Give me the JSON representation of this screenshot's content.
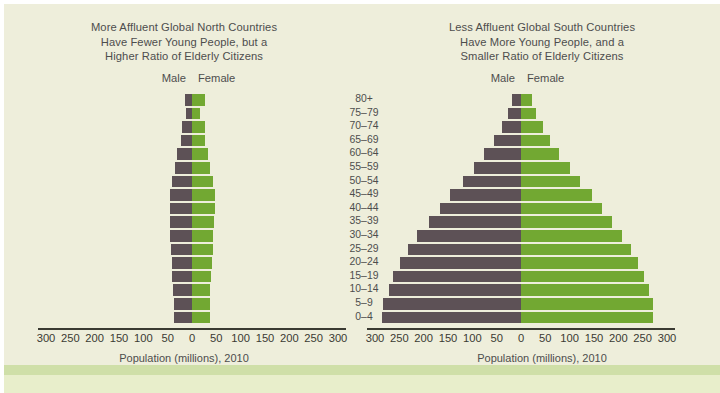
{
  "colors": {
    "background": "#eeeedb",
    "page": "#ffffff",
    "band": "#cfdfa8",
    "band_inner": "#e8eecb",
    "male": "#5d5156",
    "female": "#72a832",
    "axis": "#3a3a32",
    "text": "#4d4d4d"
  },
  "legend": {
    "male_label": "Male",
    "female_label": "Female"
  },
  "axis": {
    "title": "Population (millions), 2010",
    "ticks_left": [
      "300",
      "250",
      "200",
      "150",
      "100",
      "50",
      "0",
      "50",
      "100",
      "150",
      "200",
      "250",
      "300"
    ],
    "max": 300,
    "tick_step": 50
  },
  "age_groups": [
    "80+",
    "75–79",
    "70–74",
    "65–69",
    "60–64",
    "55–59",
    "50–54",
    "45–49",
    "40–44",
    "35–39",
    "30–34",
    "25–29",
    "20–24",
    "15–19",
    "10–14",
    "5–9",
    "0–4"
  ],
  "chart_data": [
    {
      "type": "bar",
      "id": "global-north",
      "orientation": "population-pyramid",
      "title": "More Affluent Global North Countries Have Fewer Young People, but a Higher Ratio of Elderly Citizens",
      "title_lines": [
        "More Affluent Global North Countries",
        "Have Fewer Young People, but a",
        "Higher Ratio of Elderly Citizens"
      ],
      "xlabel": "Population (millions), 2010",
      "ylabel": "",
      "xlim": [
        -300,
        300
      ],
      "grid": false,
      "legend_position": "top-center",
      "categories": [
        "80+",
        "75–79",
        "70–74",
        "65–69",
        "60–64",
        "55–59",
        "50–54",
        "45–49",
        "40–44",
        "35–39",
        "30–34",
        "25–29",
        "20–24",
        "15–19",
        "10–14",
        "5–9",
        "0–4"
      ],
      "series": [
        {
          "name": "Male",
          "values": [
            14,
            12,
            20,
            23,
            30,
            35,
            42,
            46,
            46,
            46,
            45,
            44,
            42,
            41,
            39,
            38,
            38
          ]
        },
        {
          "name": "Female",
          "values": [
            27,
            17,
            26,
            27,
            33,
            38,
            44,
            47,
            47,
            46,
            44,
            43,
            41,
            39,
            37,
            36,
            36
          ]
        }
      ]
    },
    {
      "type": "bar",
      "id": "global-south",
      "orientation": "population-pyramid",
      "title": "Less Affluent Global South Countries Have More Young People, and a Smaller Ratio of Elderly Citizens",
      "title_lines": [
        "Less Affluent Global South Countries",
        "Have More Young People, and a",
        "Smaller Ratio of Elderly Citizens"
      ],
      "xlabel": "Population (millions), 2010",
      "ylabel": "",
      "xlim": [
        -300,
        300
      ],
      "grid": false,
      "legend_position": "top-center",
      "categories": [
        "80+",
        "75–79",
        "70–74",
        "65–69",
        "60–64",
        "55–59",
        "50–54",
        "45–49",
        "40–44",
        "35–39",
        "30–34",
        "25–29",
        "20–24",
        "15–19",
        "10–14",
        "5–9",
        "0–4"
      ],
      "series": [
        {
          "name": "Male",
          "values": [
            18,
            26,
            40,
            56,
            76,
            97,
            120,
            145,
            167,
            190,
            213,
            232,
            248,
            262,
            272,
            283,
            285
          ]
        },
        {
          "name": "Female",
          "values": [
            23,
            31,
            45,
            60,
            79,
            100,
            122,
            146,
            166,
            187,
            208,
            226,
            241,
            253,
            262,
            272,
            272
          ]
        }
      ]
    }
  ]
}
